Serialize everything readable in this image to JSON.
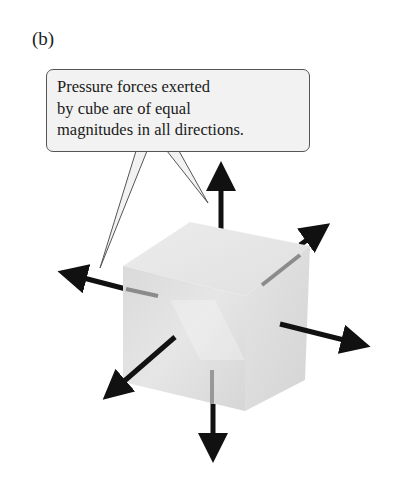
{
  "figure": {
    "panel_label": "(b)",
    "callout": {
      "lines": [
        "Pressure forces exerted",
        "by cube are of equal",
        "magnitudes in all directions."
      ]
    },
    "object": "cube",
    "arrows": [
      "up",
      "down",
      "left",
      "right",
      "front-left",
      "back-right"
    ],
    "colors": {
      "arrow": "#111111",
      "cube_light": "#eeeeee",
      "cube_mid": "#dcdcdc",
      "callout_fill": "#f2f2f2",
      "callout_border": "#555555"
    }
  }
}
